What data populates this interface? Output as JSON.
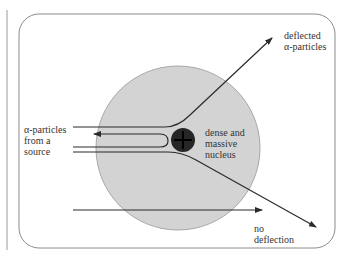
{
  "diagram": {
    "labels": {
      "source": "α-particles\nfrom a\nsource",
      "nucleus": "dense and\nmassive\nnucleus",
      "deflected": "deflected\nα-particles",
      "no_deflection": "no\ndeflection"
    },
    "colors": {
      "atom_fill": "#d3d3d3",
      "atom_stroke": "#a8a8a8",
      "nucleus_fill": "#262626",
      "line": "#2b2b2b",
      "frame": "#8c8c8c"
    },
    "nucleus_symbol": "plus-sign"
  }
}
